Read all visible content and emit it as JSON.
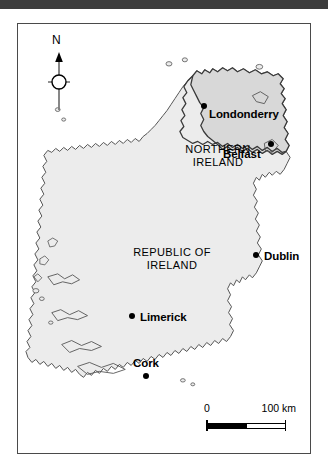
{
  "header": {
    "bar_color": "#3d3d3d"
  },
  "map": {
    "frame_border_color": "#4a4a4a",
    "background_color": "#ffffff",
    "republic_fill": "#ececec",
    "northern_ireland_fill": "#d8d8d8",
    "coast_line_color": "#555555",
    "border_line_color": "#3a3a3a",
    "compass": {
      "label": "N",
      "icon": "north-arrow-icon"
    },
    "regions": [
      {
        "id": "republic-of-ireland",
        "label_line1": "REPUBLIC OF",
        "label_line2": "IRELAND"
      },
      {
        "id": "northern-ireland",
        "label_line1": "NORTHERN",
        "label_line2": "IRELAND"
      }
    ],
    "cities": [
      {
        "id": "londonderry",
        "label": "Londonderry",
        "label_position": "right"
      },
      {
        "id": "belfast",
        "label": "Belfast",
        "label_position": "left"
      },
      {
        "id": "dublin",
        "label": "Dublin",
        "label_position": "right"
      },
      {
        "id": "limerick",
        "label": "Limerick",
        "label_position": "right"
      },
      {
        "id": "cork",
        "label": "Cork",
        "label_position": "above"
      }
    ],
    "scale": {
      "min_label": "0",
      "max_label": "100 km",
      "units": "km",
      "max_value": 100
    }
  }
}
